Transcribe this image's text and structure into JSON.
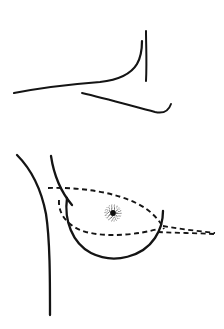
{
  "figure": {
    "caption": "",
    "canvas": {
      "width": 224,
      "height": 329
    },
    "background_color": "#ffffff",
    "ink_color": "#141414",
    "dash_color": "#151515",
    "areola_color": "#2b2b2b",
    "nipple_color": "#0d0d0d"
  },
  "upper_panel": {
    "name": "upper-contour-panel",
    "label": "",
    "strokes": [
      {
        "name": "clavicle-to-axilla-curve",
        "style": "solid",
        "width": 2.2,
        "path": "M 14 93 C 40 88 74 84 100 82 C 118 80 131 74 137 64 C 141 57 142 48 142 41"
      },
      {
        "name": "axilla-vertical-line",
        "style": "solid",
        "width": 2.0,
        "path": "M 146 31 C 146 45 147 62 146 81"
      },
      {
        "name": "lower-chest-curve",
        "style": "solid",
        "width": 1.9,
        "path": "M 82 93 C 104 98 132 106 155 112 C 164 114 169 110 171 104"
      }
    ]
  },
  "lower_panel": {
    "name": "breast-profile-panel",
    "label": "",
    "strokes": [
      {
        "name": "torso-outline-left",
        "style": "solid",
        "width": 2.3,
        "path": "M 17 155 C 30 168 41 188 46 214 C 50 240 50 278 50 315"
      },
      {
        "name": "breast-upper-slope",
        "style": "solid",
        "width": 2.3,
        "path": "M 51 156 C 54 176 61 192 72 205"
      },
      {
        "name": "breast-contour-solid",
        "style": "solid",
        "width": 2.3,
        "path": "M 67 198 C 64 220 72 243 91 253 C 115 265 143 256 155 238 C 161 229 163 219 163 211"
      }
    ],
    "dashed_strokes": [
      {
        "name": "excision-upper-dashed-arc",
        "style": "dashed",
        "width": 1.9,
        "dasharray": "5 3.5",
        "path": "M 48 188 C 80 187 115 192 138 204 C 152 211 160 221 164 229"
      },
      {
        "name": "excision-lower-dashed-arc",
        "style": "dashed",
        "width": 1.9,
        "dasharray": "5 3.5",
        "path": "M 59 200 C 58 214 68 227 86 232 C 110 238 140 234 158 229"
      },
      {
        "name": "excision-apex-dashed-upper",
        "style": "dashed",
        "width": 1.8,
        "dasharray": "5 3.5",
        "path": "M 163 226 C 180 229 198 231 215 233"
      },
      {
        "name": "excision-apex-dashed-lower",
        "style": "dashed",
        "width": 1.8,
        "dasharray": "5 3.5",
        "path": "M 158 232 C 176 233 196 233 214 234"
      }
    ],
    "areola": {
      "name": "areola",
      "center_x": 113,
      "center_y": 213,
      "outer_radius": 8.5,
      "stipple_rings": [
        3.4,
        4.6,
        5.8,
        7.0,
        8.1
      ],
      "stipple_dash": "0.7 2.1"
    },
    "nipple": {
      "name": "nipple",
      "center_x": 113,
      "center_y": 213,
      "radius": 2.9
    }
  }
}
